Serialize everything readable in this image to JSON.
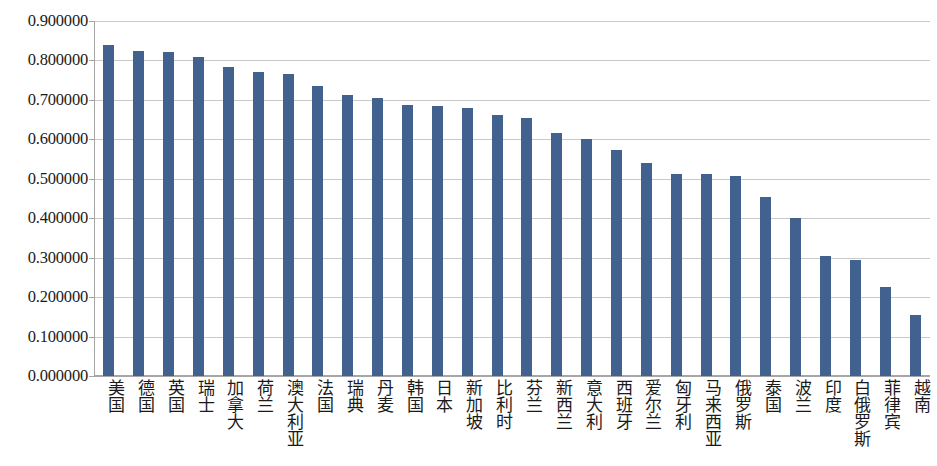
{
  "chart_data": {
    "type": "bar",
    "title": "",
    "subtitle": "",
    "xlabel": "",
    "ylabel": "",
    "ylim": [
      0.0,
      0.9
    ],
    "grid": true,
    "legend": null,
    "legend_position": "none",
    "y_ticks": [
      "0.000000",
      "0.100000",
      "0.200000",
      "0.300000",
      "0.400000",
      "0.500000",
      "0.600000",
      "0.700000",
      "0.800000",
      "0.900000"
    ],
    "y_tick_values": [
      0.0,
      0.1,
      0.2,
      0.3,
      0.4,
      0.5,
      0.6,
      0.7,
      0.8,
      0.9
    ],
    "bar_color": "#41618f",
    "grid_color": "#c9c9c9",
    "axis_color": "#a6a6a6",
    "categories": [
      "美国",
      "德国",
      "英国",
      "瑞士",
      "加拿大",
      "荷兰",
      "澳大利亚",
      "法国",
      "瑞典",
      "丹麦",
      "韩国",
      "日本",
      "新加坡",
      "比利时",
      "芬兰",
      "新西兰",
      "意大利",
      "西班牙",
      "爱尔兰",
      "匈牙利",
      "马来西亚",
      "俄罗斯",
      "泰国",
      "波兰",
      "印度",
      "白俄罗斯",
      "菲律宾",
      "越南"
    ],
    "values": [
      0.84,
      0.823,
      0.822,
      0.81,
      0.783,
      0.77,
      0.766,
      0.735,
      0.713,
      0.705,
      0.688,
      0.685,
      0.68,
      0.662,
      0.653,
      0.617,
      0.6,
      0.573,
      0.54,
      0.512,
      0.512,
      0.506,
      0.455,
      0.4,
      0.305,
      0.295,
      0.225,
      0.155
    ]
  }
}
